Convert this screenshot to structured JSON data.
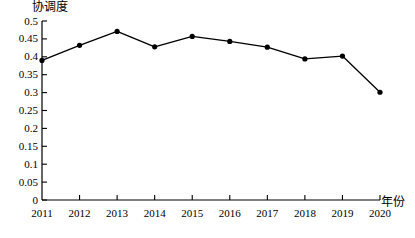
{
  "chart_data": {
    "type": "line",
    "title": "",
    "subtitle": "",
    "xlabel": "年份",
    "ylabel": "协调度",
    "categories": [
      "2011",
      "2012",
      "2013",
      "2014",
      "2015",
      "2016",
      "2017",
      "2018",
      "2019",
      "2020"
    ],
    "x": [
      2011,
      2012,
      2013,
      2014,
      2015,
      2016,
      2017,
      2018,
      2019,
      2020
    ],
    "values": [
      0.39,
      0.432,
      0.471,
      0.428,
      0.457,
      0.443,
      0.427,
      0.394,
      0.402,
      0.301
    ],
    "series": [
      {
        "name": "协调度",
        "values": [
          0.39,
          0.432,
          0.471,
          0.428,
          0.457,
          0.443,
          0.427,
          0.394,
          0.402,
          0.301
        ]
      }
    ],
    "ylim": [
      0,
      0.5
    ],
    "xlim": [
      2011,
      2020
    ],
    "y_ticks": [
      0,
      0.05,
      0.1,
      0.15,
      0.2,
      0.25,
      0.3,
      0.35,
      0.4,
      0.45,
      0.5
    ],
    "y_tick_labels": [
      "0",
      "0.05",
      "0.1",
      "0.15",
      "0.2",
      "0.25",
      "0.3",
      "0.35",
      "0.4",
      "0.45",
      "0.5"
    ],
    "x_tick_labels": [
      "2011",
      "2012",
      "2013",
      "2014",
      "2015",
      "2016",
      "2017",
      "2018",
      "2019",
      "2020"
    ],
    "grid": false,
    "legend": null,
    "legend_position": "none",
    "marker": "filled-circle",
    "line_color": "#000000",
    "marker_color": "#000000",
    "axis_color": "#000000",
    "background_color": "#ffffff",
    "annotations": []
  }
}
